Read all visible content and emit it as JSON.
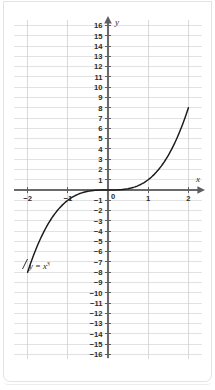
{
  "figure": {
    "background_color": "#ffffff",
    "card_border_color": "#e3e3e3",
    "grid_color": "#d6d6d6",
    "axis_color": "#6a6a6a",
    "curve_color": "#1b1b1b"
  },
  "chart_data": {
    "type": "line",
    "title": "",
    "subtitle": "",
    "xlabel": "x",
    "ylabel": "y",
    "equation_label": "y = x",
    "equation_exponent": "3",
    "function": "y = x^3",
    "grid": true,
    "legend": "none",
    "xlim": [
      -2.2,
      2.2
    ],
    "ylim": [
      -16.5,
      16.5
    ],
    "x_tick_labels": [
      "−2",
      "−1",
      "0",
      "1",
      "2"
    ],
    "x_tick_values": [
      -2,
      -1,
      0,
      1,
      2
    ],
    "x_gridline_values": [
      -2,
      -1,
      0,
      1,
      2
    ],
    "y_tick_labels": [
      "16",
      "15",
      "14",
      "13",
      "12",
      "11",
      "10",
      "9",
      "8",
      "7",
      "6",
      "5",
      "4",
      "3",
      "2",
      "1",
      "0",
      "−1",
      "−2",
      "−3",
      "−4",
      "−5",
      "−6",
      "−7",
      "−8",
      "−9",
      "−10",
      "−11",
      "−12",
      "−13",
      "−14",
      "−15",
      "−16"
    ],
    "y_tick_values": [
      16,
      15,
      14,
      13,
      12,
      11,
      10,
      9,
      8,
      7,
      6,
      5,
      4,
      3,
      2,
      1,
      0,
      -1,
      -2,
      -3,
      -4,
      -5,
      -6,
      -7,
      -8,
      -9,
      -10,
      -11,
      -12,
      -13,
      -14,
      -15,
      -16
    ],
    "origin_label": "0",
    "x": [
      -2,
      -1.8,
      -1.6,
      -1.4,
      -1.2,
      -1,
      -0.8,
      -0.6,
      -0.4,
      -0.2,
      0,
      0.2,
      0.4,
      0.6,
      0.8,
      1,
      1.2,
      1.4,
      1.6,
      1.8,
      2
    ],
    "values": [
      -8,
      -5.832,
      -4.096,
      -2.744,
      -1.728,
      -1,
      -0.512,
      -0.216,
      -0.064,
      -0.008,
      0,
      0.008,
      0.064,
      0.216,
      0.512,
      1,
      1.728,
      2.744,
      4.096,
      5.832,
      8
    ],
    "key_points": [
      {
        "x": -2,
        "y": -8
      },
      {
        "x": -1,
        "y": -1
      },
      {
        "x": 0,
        "y": 0
      },
      {
        "x": 1,
        "y": 1
      },
      {
        "x": 2,
        "y": 8
      }
    ],
    "annotations": [
      {
        "text": "y = x³",
        "x": -2,
        "y": -8,
        "position": "near-left-end-of-curve"
      }
    ]
  }
}
